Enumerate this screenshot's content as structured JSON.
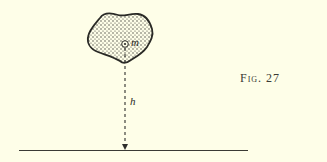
{
  "figure": {
    "caption": "Fig. 27",
    "mass_label": "m",
    "height_label": "h",
    "colors": {
      "background": "#fefee8",
      "ink": "#2e2e2a"
    },
    "elements": {
      "body": "irregular dotted blob (mass)",
      "point": "circled point mass at center of mass",
      "arrow": "dashed vertical arrow pointing down to ground",
      "ground": "horizontal ground line"
    }
  }
}
